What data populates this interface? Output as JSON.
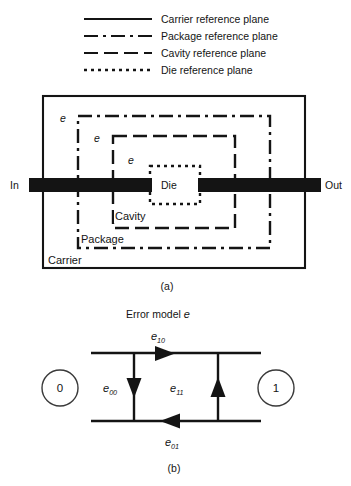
{
  "figure": {
    "legend": {
      "items": [
        {
          "id": "carrier",
          "label": "Carrier reference plane",
          "line_style": "solid",
          "dash": "none"
        },
        {
          "id": "package",
          "label": "Package reference plane",
          "line_style": "dash-dot",
          "dash": "14 5 3 5"
        },
        {
          "id": "cavity",
          "label": "Cavity reference plane",
          "line_style": "dashed",
          "dash": "14 6"
        },
        {
          "id": "die",
          "label": "Die reference plane",
          "line_style": "dotted",
          "dash": "3 4"
        }
      ]
    },
    "panel_a": {
      "caption": "(a)",
      "port_in": "In",
      "port_out": "Out",
      "regions": [
        {
          "id": "carrier",
          "label": "Carrier"
        },
        {
          "id": "package",
          "label": "Package"
        },
        {
          "id": "cavity",
          "label": "Cavity"
        },
        {
          "id": "die",
          "label": "Die"
        }
      ],
      "error_labels": [
        {
          "id": "e-outer",
          "text": "e"
        },
        {
          "id": "e-middle",
          "text": "e"
        },
        {
          "id": "e-inner",
          "text": "e"
        }
      ]
    },
    "panel_b": {
      "caption": "(b)",
      "title_text": "Error model ",
      "title_symbol": "e",
      "nodes": [
        {
          "id": "node-0",
          "label": "0"
        },
        {
          "id": "node-1",
          "label": "1"
        }
      ],
      "terms": [
        {
          "id": "e10",
          "base": "e",
          "sub": "10",
          "position": "top",
          "direction": "forward"
        },
        {
          "id": "e00",
          "base": "e",
          "sub": "00",
          "position": "left",
          "direction": "down"
        },
        {
          "id": "e11",
          "base": "e",
          "sub": "11",
          "position": "middle",
          "direction": "up"
        },
        {
          "id": "e01",
          "base": "e",
          "sub": "01",
          "position": "bottom",
          "direction": "backward"
        }
      ]
    },
    "colors": {
      "ink": "#141414",
      "background": "#ffffff"
    }
  }
}
